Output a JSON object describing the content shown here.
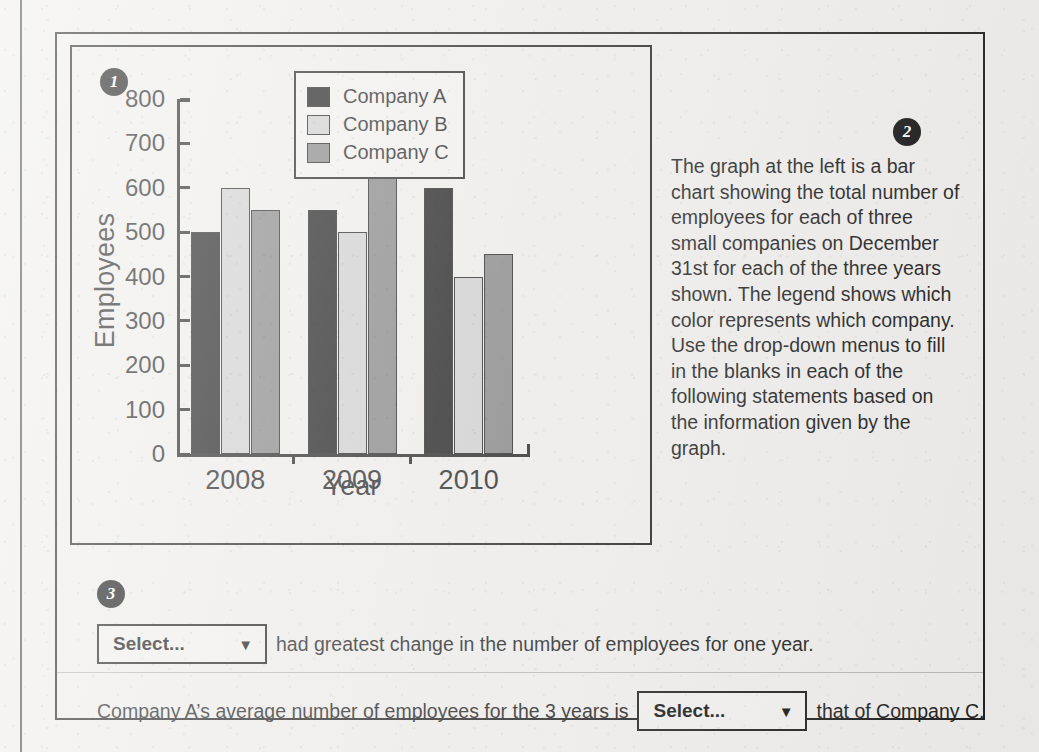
{
  "badges": {
    "one": "1",
    "two": "2",
    "three": "3"
  },
  "chart_data": {
    "type": "bar",
    "title": "",
    "xlabel": "Year",
    "ylabel": "Employees",
    "categories": [
      "2008",
      "2009",
      "2010"
    ],
    "ylim": [
      0,
      800
    ],
    "yticks": [
      800,
      700,
      600,
      500,
      400,
      300,
      200,
      100,
      0
    ],
    "grid": false,
    "legend_position": "top-right",
    "series": [
      {
        "name": "Company A",
        "color": "#141414",
        "values": [
          500,
          550,
          600
        ]
      },
      {
        "name": "Company B",
        "color": "#cfcfcf",
        "values": [
          600,
          500,
          400
        ]
      },
      {
        "name": "Company C",
        "color": "#818181",
        "values": [
          550,
          650,
          450
        ]
      }
    ]
  },
  "prose": {
    "paragraph": "The graph at the left is a bar chart showing the total number of employees for each of three small companies on December 31st for each of the three years shown. The legend shows which color represents which company. Use the drop-down menus to fill in the blanks in each of the following statements based on the information given by the graph."
  },
  "statements": {
    "one": {
      "select_value": "Select...",
      "caret": "▼",
      "text_after": "had greatest change in the number of employees for one year."
    },
    "two": {
      "text_before": "Company A’s average number of employees for the 3 years is",
      "select_value": "Select...",
      "caret": "▼",
      "text_after": "that of Company C."
    }
  }
}
